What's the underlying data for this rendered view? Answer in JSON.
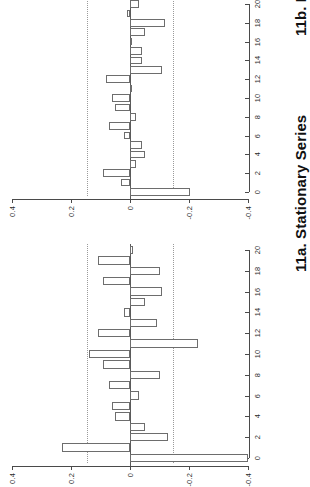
{
  "figure": {
    "orientation": "rotated-90-ccw",
    "background_color": "#ffffff",
    "ink_color": "#4a4a4a",
    "bar_edge_color": "#6d6d6d",
    "conf_line_color": "#9a9a9a"
  },
  "panels": [
    {
      "id": "panel-11b",
      "caption": "11b. Model Residuals",
      "value_axis": {
        "ticks": [
          "0.4",
          "0.2",
          "0",
          "-0.2",
          "-0.4"
        ],
        "tick_values": [
          0.4,
          0.2,
          0,
          -0.2,
          -0.4
        ]
      },
      "lag_axis": {
        "ticks": [
          "0",
          "2",
          "4",
          "6",
          "8",
          "10",
          "12",
          "14",
          "16",
          "18",
          "20"
        ],
        "tick_values": [
          0,
          2,
          4,
          6,
          8,
          10,
          12,
          14,
          16,
          18,
          20
        ]
      }
    },
    {
      "id": "panel-11a",
      "caption": "11a. Stationary Series",
      "value_axis": {
        "ticks": [
          "0.4",
          "0.2",
          "0",
          "-0.2",
          "-0.4"
        ],
        "tick_values": [
          0.4,
          0.2,
          0,
          -0.2,
          -0.4
        ]
      },
      "lag_axis": {
        "ticks": [
          "0",
          "2",
          "4",
          "6",
          "8",
          "10",
          "12",
          "14",
          "16",
          "18",
          "20"
        ],
        "tick_values": [
          0,
          2,
          4,
          6,
          8,
          10,
          12,
          14,
          16,
          18,
          20
        ]
      }
    }
  ],
  "chart_data": [
    {
      "type": "bar",
      "id": "panel-11a",
      "title": "11a. Stationary Series",
      "xlabel": "",
      "ylabel": "",
      "orientation": "horizontal",
      "grid": false,
      "legend": false,
      "xlim": [
        0,
        20
      ],
      "ylim": [
        -0.4,
        0.4
      ],
      "x": [
        0,
        1,
        2,
        3,
        4,
        5,
        6,
        7,
        8,
        9,
        10,
        11,
        12,
        13,
        14,
        15,
        16,
        17,
        18,
        19,
        20
      ],
      "categories": [
        "0",
        "1",
        "2",
        "3",
        "4",
        "5",
        "6",
        "7",
        "8",
        "9",
        "10",
        "11",
        "12",
        "13",
        "14",
        "15",
        "16",
        "17",
        "18",
        "19",
        "20"
      ],
      "values": [
        -0.4,
        0.23,
        -0.13,
        -0.05,
        0.05,
        0.06,
        -0.03,
        0.07,
        -0.1,
        0.09,
        0.14,
        -0.23,
        0.11,
        -0.09,
        0.02,
        -0.05,
        -0.11,
        0.09,
        -0.1,
        0.11,
        -0.01
      ],
      "confidence_bounds": [
        -0.145,
        0.145
      ],
      "confidence_style": "dotted",
      "bar_fill": "#ffffff",
      "bar_edge": "#6d6d6d"
    },
    {
      "type": "bar",
      "id": "panel-11b",
      "title": "11b. Model Residuals",
      "xlabel": "",
      "ylabel": "",
      "orientation": "horizontal",
      "grid": false,
      "legend": false,
      "xlim": [
        0,
        20
      ],
      "ylim": [
        -0.4,
        0.4
      ],
      "x": [
        0,
        1,
        2,
        3,
        4,
        5,
        6,
        7,
        8,
        9,
        10,
        11,
        12,
        13,
        14,
        15,
        16,
        17,
        18,
        19,
        20
      ],
      "categories": [
        "0",
        "1",
        "2",
        "3",
        "4",
        "5",
        "6",
        "7",
        "8",
        "9",
        "10",
        "11",
        "12",
        "13",
        "14",
        "15",
        "16",
        "17",
        "18",
        "19",
        "20"
      ],
      "values": [
        -0.205,
        0.03,
        0.09,
        -0.02,
        -0.05,
        -0.04,
        0.02,
        0.07,
        -0.02,
        0.05,
        0.06,
        -0.005,
        0.08,
        -0.11,
        -0.04,
        -0.04,
        0.0,
        -0.05,
        -0.12,
        0.01,
        -0.03
      ],
      "confidence_bounds": [
        -0.145,
        0.145
      ],
      "confidence_style": "dotted",
      "bar_fill": "#ffffff",
      "bar_edge": "#6d6d6d"
    }
  ]
}
